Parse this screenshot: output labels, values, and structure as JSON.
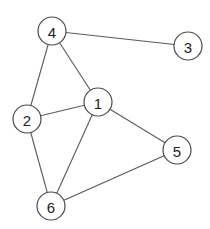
{
  "diagram": {
    "type": "undirected-graph",
    "node_radius": 14,
    "colors": {
      "edge": "#5a5a5a",
      "node_stroke": "#4a4a4a",
      "node_fill": "#ffffff",
      "label": "#222222"
    },
    "nodes": [
      {
        "id": "1",
        "label": "1",
        "x": 98,
        "y": 102
      },
      {
        "id": "2",
        "label": "2",
        "x": 27,
        "y": 119
      },
      {
        "id": "3",
        "label": "3",
        "x": 188,
        "y": 46
      },
      {
        "id": "4",
        "label": "4",
        "x": 52,
        "y": 31
      },
      {
        "id": "5",
        "label": "5",
        "x": 177,
        "y": 150
      },
      {
        "id": "6",
        "label": "6",
        "x": 51,
        "y": 206
      }
    ],
    "edges": [
      {
        "from": "4",
        "to": "3"
      },
      {
        "from": "4",
        "to": "2"
      },
      {
        "from": "4",
        "to": "1"
      },
      {
        "from": "2",
        "to": "1"
      },
      {
        "from": "2",
        "to": "6"
      },
      {
        "from": "1",
        "to": "6"
      },
      {
        "from": "1",
        "to": "5"
      },
      {
        "from": "6",
        "to": "5"
      }
    ]
  }
}
